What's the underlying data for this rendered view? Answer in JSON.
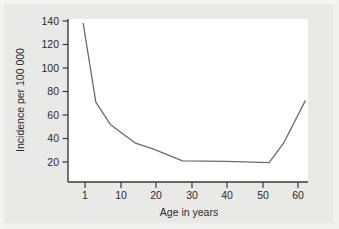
{
  "chart_data": {
    "type": "line",
    "title": "",
    "xlabel": "Age in years",
    "ylabel": "Incidence per 100 000",
    "xlim": [
      0,
      64
    ],
    "ylim": [
      8,
      145
    ],
    "xticks": [
      1,
      10,
      20,
      30,
      40,
      50,
      60
    ],
    "xtick_labels": [
      "1",
      "10",
      "20",
      "30",
      "40",
      "50",
      "60"
    ],
    "yticks": [
      20,
      40,
      60,
      80,
      100,
      120,
      140
    ],
    "ytick_labels": [
      "20",
      "40",
      "60",
      "80",
      "100",
      "120",
      "140"
    ],
    "grid": false,
    "legend": "none",
    "series": [
      {
        "name": "Incidence",
        "color": "#6b6b6b",
        "x": [
          0.5,
          4,
          8,
          15,
          20,
          28,
          40,
          52,
          56,
          62
        ],
        "values": [
          138,
          71,
          52,
          36,
          31,
          21,
          20.5,
          19.5,
          36,
          72
        ]
      }
    ]
  },
  "axes": {
    "y_title": "Incidence per 100 000",
    "x_title": "Age in years",
    "y_labels": [
      "140",
      "120",
      "100",
      "80",
      "60",
      "40",
      "20"
    ],
    "x_labels": [
      "1",
      "10",
      "20",
      "30",
      "40",
      "50",
      "60"
    ]
  },
  "colors": {
    "background": "#e9e9e7",
    "plot_background": "#ffffff",
    "line": "#6b6b6b",
    "axis": "#3a3a3a",
    "text": "#2a2a2a"
  }
}
